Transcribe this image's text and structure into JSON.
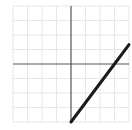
{
  "chart_data": {
    "type": "line",
    "title": "",
    "xlabel": "",
    "ylabel": "",
    "xlim": [
      -4,
      4
    ],
    "ylim": [
      -4,
      4
    ],
    "grid": true,
    "grid_step": 1,
    "legend": null,
    "series": [
      {
        "name": "f(x)",
        "equation": "y = (4/3)x - 4, 0 <= x <= 4",
        "x": [
          0,
          3,
          4
        ],
        "y": [
          -4,
          0,
          1.333
        ]
      }
    ]
  },
  "colors": {
    "grid": "#e6e6e6",
    "axis": "#555555",
    "line": "#1a1a1a",
    "background": "#ffffff"
  },
  "layout": {
    "origin_px": [
      71,
      64
    ],
    "unit_px": 14.5
  }
}
